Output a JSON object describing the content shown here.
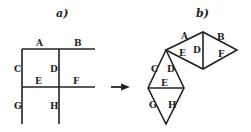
{
  "panels": {
    "a": {
      "title": "a)",
      "labels": {
        "A": "A",
        "B": "B",
        "C": "C",
        "D": "D",
        "E": "E",
        "F": "F",
        "G": "G",
        "H": "H"
      }
    },
    "b": {
      "title": "b)",
      "labels": {
        "A": "A",
        "B": "B",
        "C": "C",
        "D1": "D",
        "D2": "D",
        "E1": "E",
        "E2": "E",
        "F": "F",
        "G": "G",
        "H": "H"
      }
    }
  },
  "arrow": {
    "direction": "right"
  }
}
